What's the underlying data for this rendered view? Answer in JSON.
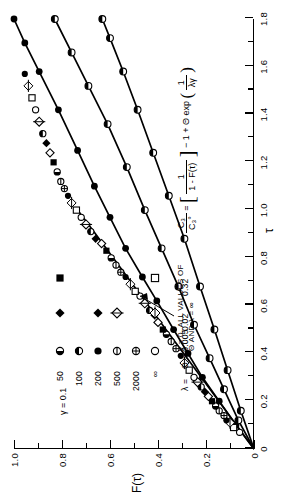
{
  "chart_data": {
    "type": "line",
    "title": "",
    "xlabel": "τ",
    "ylabel": "F(τ)",
    "xlim": [
      0,
      1.8
    ],
    "ylim": [
      0,
      1.0
    ],
    "xticks": [
      0,
      0.2,
      0.4,
      0.6,
      0.8,
      1.0,
      1.2,
      1.4,
      1.6,
      1.8
    ],
    "xticklabels": [
      "0",
      "0.2",
      "0.4",
      "0.6",
      "0.8",
      "1.0",
      "1.2",
      "1.4",
      "1.6",
      "1.8"
    ],
    "yticks": [
      0,
      0.2,
      0.4,
      0.6,
      0.8,
      1.0
    ],
    "yticklabels": [
      "0",
      "0.2",
      "0.4",
      "0.6",
      "0.8",
      "1.0"
    ],
    "minor_tick_step_x": 0.1,
    "minor_tick_step_y": 0.1,
    "grid": false,
    "legend_position": "inner-left",
    "series": [
      {
        "name": "curve-limiting",
        "style": "solid-no-markers",
        "points": [
          [
            0,
            0
          ],
          [
            0.3,
            0.22
          ],
          [
            0.6,
            0.44
          ],
          [
            0.9,
            0.66
          ],
          [
            1.0,
            0.735
          ]
        ]
      },
      {
        "name": "curve-A",
        "style": "solid-filled-circles",
        "points": [
          [
            0,
            0
          ],
          [
            0.1,
            0.075
          ],
          [
            0.2,
            0.145
          ],
          [
            0.3,
            0.215
          ],
          [
            0.4,
            0.275
          ],
          [
            0.5,
            0.335
          ],
          [
            0.62,
            0.405
          ],
          [
            0.72,
            0.465
          ],
          [
            0.84,
            0.535
          ],
          [
            0.97,
            0.6
          ],
          [
            1.1,
            0.665
          ],
          [
            1.25,
            0.735
          ],
          [
            1.42,
            0.815
          ],
          [
            1.58,
            0.895
          ],
          [
            1.7,
            0.955
          ],
          [
            1.8,
            1.0
          ]
        ]
      },
      {
        "name": "curve-B",
        "style": "solid-half-circles",
        "points": [
          [
            0,
            0
          ],
          [
            0.12,
            0.065
          ],
          [
            0.25,
            0.125
          ],
          [
            0.38,
            0.185
          ],
          [
            0.52,
            0.25
          ],
          [
            0.68,
            0.315
          ],
          [
            0.84,
            0.385
          ],
          [
            1.0,
            0.455
          ],
          [
            1.18,
            0.53
          ],
          [
            1.36,
            0.61
          ],
          [
            1.52,
            0.69
          ],
          [
            1.66,
            0.76
          ],
          [
            1.8,
            0.83
          ]
        ]
      },
      {
        "name": "curve-C",
        "style": "solid-half-circles",
        "points": [
          [
            0,
            0
          ],
          [
            0.16,
            0.055
          ],
          [
            0.33,
            0.11
          ],
          [
            0.5,
            0.165
          ],
          [
            0.68,
            0.225
          ],
          [
            0.88,
            0.29
          ],
          [
            1.06,
            0.355
          ],
          [
            1.24,
            0.42
          ],
          [
            1.42,
            0.485
          ],
          [
            1.58,
            0.545
          ],
          [
            1.72,
            0.6
          ],
          [
            1.8,
            0.632
          ]
        ]
      }
    ],
    "scatter_points": [
      [
        0.07,
        0.06
      ],
      [
        0.09,
        0.085
      ],
      [
        0.11,
        0.1
      ],
      [
        0.12,
        0.115
      ],
      [
        0.14,
        0.125
      ],
      [
        0.16,
        0.145
      ],
      [
        0.18,
        0.16
      ],
      [
        0.2,
        0.175
      ],
      [
        0.22,
        0.19
      ],
      [
        0.24,
        0.205
      ],
      [
        0.26,
        0.22
      ],
      [
        0.28,
        0.235
      ],
      [
        0.3,
        0.25
      ],
      [
        0.33,
        0.27
      ],
      [
        0.36,
        0.29
      ],
      [
        0.39,
        0.305
      ],
      [
        0.42,
        0.325
      ],
      [
        0.45,
        0.345
      ],
      [
        0.48,
        0.365
      ],
      [
        0.5,
        0.38
      ],
      [
        0.53,
        0.4
      ],
      [
        0.56,
        0.415
      ],
      [
        0.58,
        0.435
      ],
      [
        0.61,
        0.455
      ],
      [
        0.64,
        0.475
      ],
      [
        0.66,
        0.495
      ],
      [
        0.69,
        0.515
      ],
      [
        0.72,
        0.535
      ],
      [
        0.74,
        0.555
      ],
      [
        0.77,
        0.575
      ],
      [
        0.8,
        0.595
      ],
      [
        0.83,
        0.615
      ],
      [
        0.86,
        0.635
      ],
      [
        0.88,
        0.66
      ],
      [
        0.91,
        0.68
      ],
      [
        0.94,
        0.7
      ],
      [
        0.97,
        0.72
      ],
      [
        1.0,
        0.74
      ],
      [
        1.03,
        0.76
      ],
      [
        1.06,
        0.775
      ],
      [
        1.09,
        0.79
      ],
      [
        1.12,
        0.805
      ],
      [
        1.16,
        0.82
      ],
      [
        1.2,
        0.835
      ],
      [
        1.24,
        0.85
      ],
      [
        1.28,
        0.865
      ],
      [
        1.32,
        0.88
      ],
      [
        1.37,
        0.895
      ],
      [
        1.42,
        0.91
      ],
      [
        1.47,
        0.925
      ],
      [
        1.52,
        0.94
      ],
      [
        1.57,
        0.955
      ]
    ]
  },
  "axes": {
    "x_name": "τ",
    "y_name": "F(τ)"
  },
  "legend": {
    "gamma_header": "γ = 0.1",
    "lambda_header": "λ =",
    "theta_headers": [
      "Θ = 0.005",
      "0.02",
      "0.32"
    ],
    "rows": [
      {
        "lambda": "50",
        "symbols": [
          "half-left-circle",
          "filled-diamond",
          "filled-square"
        ]
      },
      {
        "lambda": "100",
        "symbols": [
          "half-top-circle",
          "",
          ""
        ]
      },
      {
        "lambda": "200",
        "symbols": [
          "filled-circle",
          "filled-diamond",
          ""
        ]
      },
      {
        "lambda": "500",
        "symbols": [
          "barred-circle",
          "barred-diamond",
          ""
        ]
      },
      {
        "lambda": "2000",
        "symbols": [
          "crossed-circle",
          "",
          ""
        ]
      },
      {
        "lambda": "∞",
        "symbols": [
          "open-circle",
          "open-diamond-circle",
          "open-square"
        ]
      }
    ]
  },
  "annotations": {
    "limit_note_line1": "γ = 0, ALL VALUES OF",
    "limit_note_line2": "Θ AND λ = ∞",
    "equation": {
      "lhs_num": "C₃",
      "lhs_den": "C₃°",
      "equals": "=",
      "bracket_open": "[",
      "bracket_close": "]",
      "inner_num": "1",
      "inner_den": "1 - F(τ)",
      "minus": "−",
      "den_prefix": "1 + Θ exp",
      "exp_num": "1",
      "exp_den": "λγ"
    }
  },
  "colors": {
    "ink": "#000000",
    "background": "#ffffff"
  }
}
